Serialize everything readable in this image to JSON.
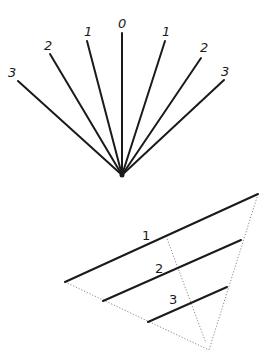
{
  "fan_diagram": {
    "apex": [
      122,
      175
    ],
    "rays": [
      {
        "label": "3",
        "end": [
          18,
          81
        ],
        "label_pos": [
          8,
          77
        ]
      },
      {
        "label": "2",
        "end": [
          50,
          54
        ],
        "label_pos": [
          44,
          50
        ]
      },
      {
        "label": "1",
        "end": [
          87,
          41
        ],
        "label_pos": [
          84,
          36
        ]
      },
      {
        "label": "0",
        "end": [
          122,
          33
        ],
        "label_pos": [
          118,
          28
        ]
      },
      {
        "label": "1",
        "end": [
          165,
          41
        ],
        "label_pos": [
          162,
          36
        ]
      },
      {
        "label": "2",
        "end": [
          201,
          58
        ],
        "label_pos": [
          200,
          52
        ]
      },
      {
        "label": "3",
        "end": [
          224,
          80
        ],
        "label_pos": [
          221,
          76
        ]
      }
    ]
  },
  "triangle_diagram": {
    "lines": [
      {
        "label": "1",
        "from": [
          65,
          282
        ],
        "to": [
          258,
          194
        ],
        "label_pos": [
          142,
          240
        ]
      },
      {
        "label": "2",
        "from": [
          103,
          301
        ],
        "to": [
          241,
          240
        ],
        "label_pos": [
          155,
          273
        ]
      },
      {
        "label": "3",
        "from": [
          148,
          322
        ],
        "to": [
          227,
          287
        ],
        "label_pos": [
          169,
          304
        ]
      }
    ],
    "dotted": [
      {
        "from": [
          65,
          282
        ],
        "to": [
          209,
          350
        ]
      },
      {
        "from": [
          258,
          194
        ],
        "to": [
          209,
          350
        ]
      },
      {
        "from": [
          166,
          236
        ],
        "to": [
          206,
          343
        ]
      }
    ]
  }
}
